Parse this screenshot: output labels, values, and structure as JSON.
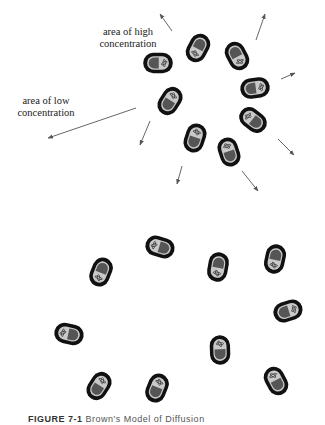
{
  "figure": {
    "labels": {
      "high": "area of high\nconcentration",
      "low": "area of low\nconcentration"
    },
    "caption": {
      "prefix": "FIGURE 7-1",
      "text": "Brown's Model of Diffusion"
    },
    "colors": {
      "outline": "#111111",
      "body": "#c9c9c9",
      "nucleus": "#555555",
      "arrow": "#555555"
    }
  },
  "cells_top": [
    {
      "x": 158,
      "y": 63,
      "rot": 0
    },
    {
      "x": 198,
      "y": 48,
      "rot": 118
    },
    {
      "x": 237,
      "y": 56,
      "rot": 62
    },
    {
      "x": 255,
      "y": 88,
      "rot": -8
    },
    {
      "x": 170,
      "y": 101,
      "rot": -58
    },
    {
      "x": 253,
      "y": 120,
      "rot": -142
    },
    {
      "x": 195,
      "y": 138,
      "rot": -72
    },
    {
      "x": 229,
      "y": 152,
      "rot": -108
    }
  ],
  "cells_bottom": [
    {
      "x": 101,
      "y": 272,
      "rot": 112
    },
    {
      "x": 160,
      "y": 247,
      "rot": 197
    },
    {
      "x": 218,
      "y": 267,
      "rot": 100
    },
    {
      "x": 275,
      "y": 259,
      "rot": 102
    },
    {
      "x": 288,
      "y": 311,
      "rot": -18
    },
    {
      "x": 69,
      "y": 334,
      "rot": 192
    },
    {
      "x": 220,
      "y": 350,
      "rot": -92
    },
    {
      "x": 276,
      "y": 381,
      "rot": -118
    },
    {
      "x": 99,
      "y": 386,
      "rot": -58
    },
    {
      "x": 157,
      "y": 388,
      "rot": -68
    }
  ],
  "arrows": [
    {
      "x1": 172,
      "y1": 31,
      "x2": 160,
      "y2": 14
    },
    {
      "x1": 256,
      "y1": 40,
      "x2": 265,
      "y2": 14
    },
    {
      "x1": 281,
      "y1": 79,
      "x2": 295,
      "y2": 73
    },
    {
      "x1": 278,
      "y1": 139,
      "x2": 294,
      "y2": 155
    },
    {
      "x1": 242,
      "y1": 171,
      "x2": 258,
      "y2": 191
    },
    {
      "x1": 182,
      "y1": 166,
      "x2": 177,
      "y2": 184
    },
    {
      "x1": 150,
      "y1": 121,
      "x2": 140,
      "y2": 145
    },
    {
      "x1": 136,
      "y1": 108,
      "x2": 48,
      "y2": 138
    }
  ]
}
